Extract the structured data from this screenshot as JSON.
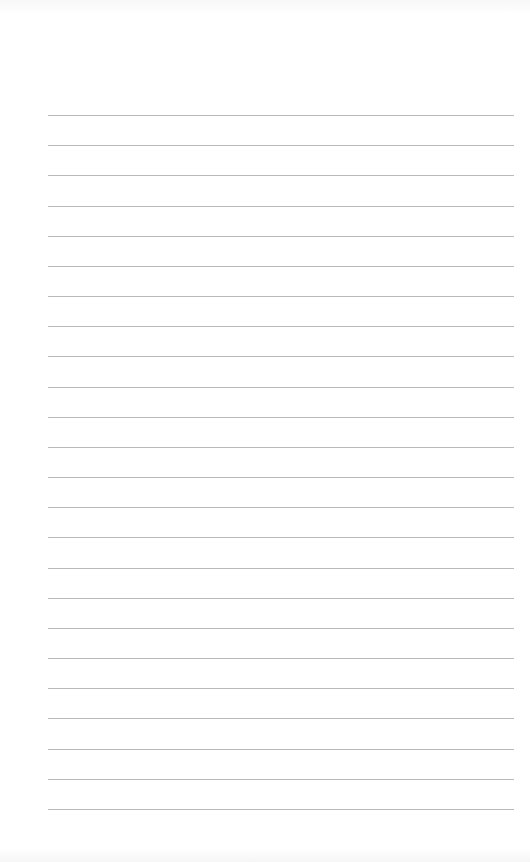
{
  "page": {
    "type": "lined-paper",
    "background_color": "#ffffff",
    "line_color": "#b9b9b9",
    "line_count": 24,
    "first_line_y": 115,
    "line_spacing": 30.17,
    "line_left": 48,
    "line_width": 466
  }
}
